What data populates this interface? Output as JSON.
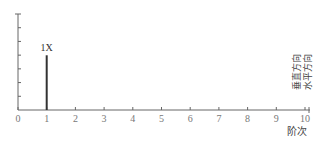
{
  "chart_data": {
    "type": "bar",
    "title": "",
    "xlabel": "阶次",
    "ylabel": "",
    "x_ticks": [
      0,
      1,
      2,
      3,
      4,
      5,
      6,
      7,
      8,
      9,
      10
    ],
    "xlim": [
      0,
      10
    ],
    "ylim": [
      0,
      1
    ],
    "y_tick_count": 7,
    "y_tick_labels_shown": false,
    "grid": false,
    "series": [
      {
        "name": "垂直方向",
        "x": [
          1
        ],
        "values": [
          0.57
        ],
        "annotations": [
          "1X"
        ]
      }
    ],
    "legend": [
      "垂直方向",
      "水平方向"
    ],
    "legend_position": "right, vertical text"
  },
  "axis": {
    "xlabel": "阶次"
  },
  "legend": {
    "vertical": "垂直方向",
    "horizontal": "水平方向"
  },
  "bar_label": "1X"
}
